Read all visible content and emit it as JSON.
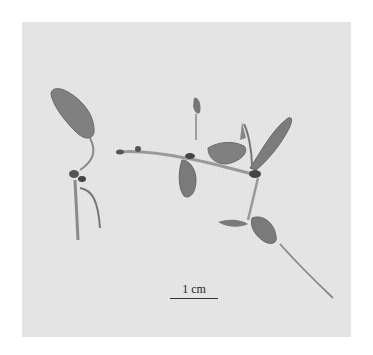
{
  "image": {
    "description": "Photograph of a dried plant seedling specimen with leaves and roots on a light gray background",
    "background_color": "#e6e6e6",
    "specimen_color": "#7a7a7a"
  },
  "scale_bar": {
    "label": "1 cm"
  }
}
